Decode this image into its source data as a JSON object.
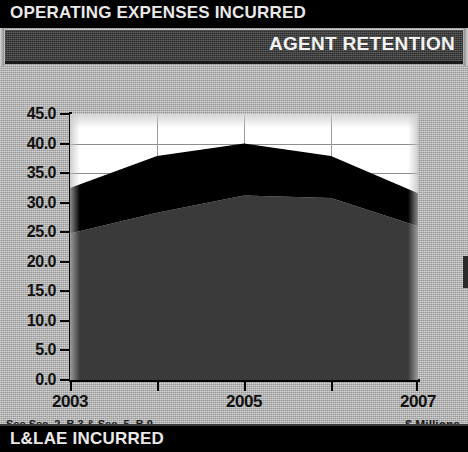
{
  "top_banner": {
    "title": "OPERATING EXPENSES INCURRED"
  },
  "section_header": {
    "title": "AGENT RETENTION"
  },
  "bottom_banner": {
    "title": "L&LAE INCURRED"
  },
  "footnotes": {
    "left": "See Sec. 2, B.3 & Sec. 5, B.9",
    "right": "$ Millions"
  },
  "colors": {
    "banner_background": "#000000",
    "section_header_background": "#3c3c3c",
    "panel_background": "#b9b9b9",
    "plot_background": "#ffffff",
    "series_lower": "#3a3a3a",
    "series_upper": "#000000",
    "gridline": "#8d8d8d",
    "axis": "#000000"
  },
  "chart_data": {
    "type": "area",
    "stacked": true,
    "title": "AGENT RETENTION",
    "xlabel": "",
    "ylabel": "$ Millions",
    "x": [
      2003,
      2004,
      2005,
      2006,
      2007
    ],
    "categories": [
      "2003",
      "2004",
      "2005",
      "2006",
      "2007"
    ],
    "x_tick_labels": [
      "2003",
      "",
      "2005",
      "",
      "2007"
    ],
    "y_tick_labels": [
      "45.0",
      "40.0",
      "35.0",
      "30.0",
      "25.0",
      "20.0",
      "15.0",
      "10.0",
      "5.0",
      "0.0"
    ],
    "y_ticks": [
      45.0,
      40.0,
      35.0,
      30.0,
      25.0,
      20.0,
      15.0,
      10.0,
      5.0,
      0.0
    ],
    "ylim": [
      0.0,
      45.0
    ],
    "gridlines": [
      "horizontal at 40.0",
      "horizontal at 35.0",
      "vertical at each year"
    ],
    "legend": "none",
    "series": [
      {
        "name": "lower-band",
        "color": "#3a3a3a",
        "values": [
          24.8,
          28.3,
          31.2,
          30.8,
          26.0
        ]
      },
      {
        "name": "upper-band",
        "color": "#000000",
        "values": [
          7.7,
          9.6,
          8.8,
          7.1,
          5.6
        ]
      }
    ],
    "cumulative_totals": [
      32.5,
      37.9,
      40.0,
      37.9,
      31.6
    ]
  }
}
